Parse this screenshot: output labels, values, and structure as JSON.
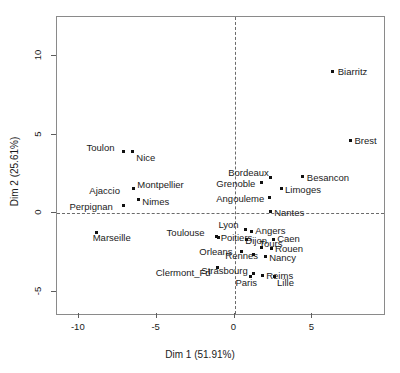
{
  "chart_data": {
    "type": "scatter",
    "title": "",
    "xlabel": "Dim 1 (51.91%)",
    "ylabel": "Dim 2 (25.61%)",
    "xlim": [
      -11.4,
      9.6
    ],
    "ylim": [
      -6.4,
      12.5
    ],
    "xticks": [
      -10,
      -5,
      0,
      5
    ],
    "xticklabels": [
      "-10",
      "-5",
      "0",
      "5"
    ],
    "yticks": [
      10,
      5,
      0,
      -5
    ],
    "yticklabels": [
      "10",
      "5",
      "0",
      "-5"
    ],
    "grid": false,
    "reference_lines": {
      "x": 0,
      "y": 0,
      "style": "dashed"
    },
    "legend": "none",
    "point_color": "#111111",
    "points": [
      {
        "label": "Biarritz",
        "x": 6.31,
        "y": 9.05,
        "lx": 5,
        "ly": -4
      },
      {
        "label": "Brest",
        "x": 7.45,
        "y": 4.67,
        "lx": 4,
        "ly": -4
      },
      {
        "label": "Besancon",
        "x": 4.39,
        "y": 2.35,
        "lx": 4,
        "ly": -4
      },
      {
        "label": "Bordeaux",
        "x": 2.29,
        "y": 2.29,
        "lx": -42,
        "ly": -9
      },
      {
        "label": "Limoges",
        "x": 2.99,
        "y": 1.57,
        "lx": 4,
        "ly": -4
      },
      {
        "label": "Grenoble",
        "x": 1.72,
        "y": 1.94,
        "lx": -45,
        "ly": -4
      },
      {
        "label": "Angouleme",
        "x": 2.23,
        "y": 1.0,
        "lx": -53,
        "ly": -4
      },
      {
        "label": "Nantes",
        "x": 2.29,
        "y": 0.13,
        "lx": 4,
        "ly": -3
      },
      {
        "label": "Toulon",
        "x": -7.13,
        "y": 3.92,
        "lx": -37,
        "ly": -9
      },
      {
        "label": "Nice",
        "x": -6.56,
        "y": 3.92,
        "lx": 4,
        "ly": 1
      },
      {
        "label": "Montpellier",
        "x": -6.5,
        "y": 1.57,
        "lx": 4,
        "ly": -9
      },
      {
        "label": "Ajaccio",
        "x": -6.5,
        "y": 1.57,
        "lx": -44,
        "ly": -3
      },
      {
        "label": "Nimes",
        "x": -6.18,
        "y": 0.88,
        "lx": 4,
        "ly": -3
      },
      {
        "label": "Perpignan",
        "x": -7.13,
        "y": 0.5,
        "lx": -54,
        "ly": -4
      },
      {
        "label": "Marseille",
        "x": -8.85,
        "y": -1.19,
        "lx": -4,
        "ly": 1
      },
      {
        "label": "Toulouse",
        "x": -1.15,
        "y": -1.44,
        "lx": -50,
        "ly": -8
      },
      {
        "label": "Lyon",
        "x": 0.7,
        "y": -1.0,
        "lx": -27,
        "ly": -9
      },
      {
        "label": "Angers",
        "x": 1.08,
        "y": -1.13,
        "lx": 4,
        "ly": -5
      },
      {
        "label": "Poitiers",
        "x": -1.02,
        "y": -1.5,
        "lx": 2,
        "ly": -4
      },
      {
        "label": "Dijon",
        "x": 0.76,
        "y": -1.69,
        "lx": -1,
        "ly": -4
      },
      {
        "label": "Caen",
        "x": 2.48,
        "y": -1.63,
        "lx": 4,
        "ly": -5
      },
      {
        "label": "Tours",
        "x": 1.72,
        "y": -2.16,
        "lx": -2,
        "ly": -8
      },
      {
        "label": "Rouen",
        "x": 2.35,
        "y": -2.22,
        "lx": 4,
        "ly": -4
      },
      {
        "label": "Orleans",
        "x": 0.44,
        "y": -2.41,
        "lx": -42,
        "ly": -4
      },
      {
        "label": "Rennes",
        "x": 1.21,
        "y": -2.6,
        "lx": -28,
        "ly": -3
      },
      {
        "label": "Nancy",
        "x": 1.97,
        "y": -2.72,
        "lx": 4,
        "ly": -3
      },
      {
        "label": "Strasbourg",
        "x": 1.21,
        "y": -3.85,
        "lx": -52,
        "ly": -8
      },
      {
        "label": "Clermont_Fd",
        "x": -1.08,
        "y": -3.41,
        "lx": -62,
        "ly": 1
      },
      {
        "label": "Paris",
        "x": 1.02,
        "y": -4.04,
        "lx": -15,
        "ly": 1
      },
      {
        "label": "Reims",
        "x": 1.78,
        "y": -3.98,
        "lx": 4,
        "ly": -5
      },
      {
        "label": "Lille",
        "x": 2.54,
        "y": -4.04,
        "lx": 3,
        "ly": 1
      }
    ]
  }
}
